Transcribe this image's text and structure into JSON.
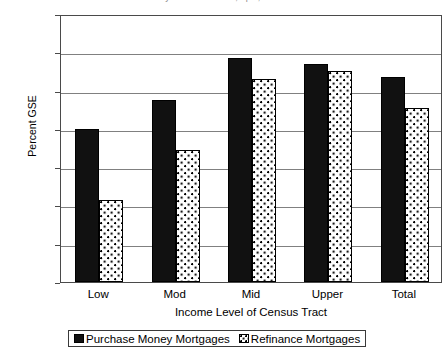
{
  "chart_data": {
    "type": "bar",
    "title": "",
    "title_clipped": "y of Census Tract, April, 2000",
    "xlabel": "Income Level of Census Tract",
    "ylabel": "Percent GSE",
    "categories": [
      "Low",
      "Mod",
      "Mid",
      "Upper",
      "Total"
    ],
    "series": [
      {
        "name": "Purchase Money Mortgages",
        "values": [
          40,
          47.5,
          58.5,
          57,
          53.5
        ],
        "fill": "solid-black",
        "color": "#111111"
      },
      {
        "name": "Refinance Mortgages",
        "values": [
          21.5,
          34.5,
          53,
          55,
          45.5
        ],
        "fill": "white-dotted",
        "color": "#ffffff"
      }
    ],
    "ylim": [
      0,
      70
    ],
    "ytick_labels": [
      "0",
      "10",
      "20",
      "30",
      "40",
      "50",
      "60",
      "70"
    ],
    "ytick_values": [
      0,
      10,
      20,
      30,
      40,
      50,
      60,
      70
    ],
    "grid": true,
    "grid_axis": "y",
    "legend_position": "bottom"
  },
  "legend": {
    "items": [
      {
        "label": "Purchase Money Mortgages"
      },
      {
        "label": "Refinance Mortgages"
      }
    ]
  }
}
